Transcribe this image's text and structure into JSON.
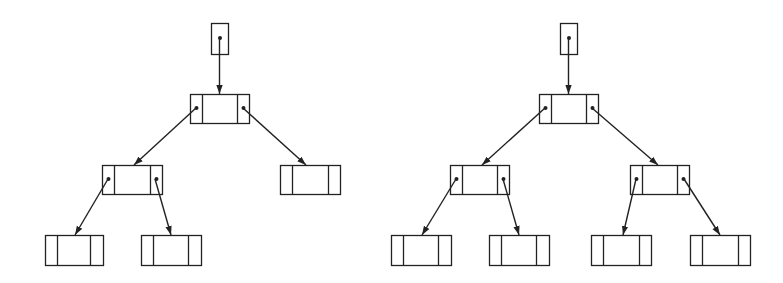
{
  "diagram": {
    "title": "",
    "stroke_color": "#222222",
    "background": "#ffffff",
    "trees": [
      {
        "id": "tree-left",
        "pointer": {
          "x": 211,
          "y": 23,
          "w": 17,
          "h": 31
        },
        "nodes": [
          {
            "id": "root",
            "x": 190,
            "y": 94,
            "w": 59,
            "h": 29,
            "d1": 202,
            "d2": 237,
            "has_left": true,
            "has_right": true
          },
          {
            "id": "L",
            "x": 102,
            "y": 165,
            "w": 60,
            "h": 29,
            "d1": 114,
            "d2": 150,
            "has_left": true,
            "has_right": true
          },
          {
            "id": "R",
            "x": 280,
            "y": 165,
            "w": 60,
            "h": 29,
            "d1": 292,
            "d2": 328,
            "has_left": false,
            "has_right": false
          },
          {
            "id": "LL",
            "x": 45,
            "y": 235,
            "w": 58,
            "h": 30,
            "d1": 57,
            "d2": 90,
            "has_left": false,
            "has_right": false
          },
          {
            "id": "LR",
            "x": 141,
            "y": 235,
            "w": 60,
            "h": 30,
            "d1": 153,
            "d2": 188,
            "has_left": false,
            "has_right": false
          }
        ],
        "edges": [
          {
            "from": "pointer",
            "to": "root",
            "x1": 219.5,
            "y1": 38,
            "x2": 219.5,
            "y2": 94
          },
          {
            "from": "root",
            "to": "L",
            "x1": 196,
            "y1": 108,
            "x2": 134,
            "y2": 165
          },
          {
            "from": "root",
            "to": "R",
            "x1": 243,
            "y1": 108,
            "x2": 306,
            "y2": 165
          },
          {
            "from": "L",
            "to": "LL",
            "x1": 108,
            "y1": 179,
            "x2": 75,
            "y2": 235
          },
          {
            "from": "L",
            "to": "LR",
            "x1": 155,
            "y1": 179,
            "x2": 171,
            "y2": 235
          }
        ]
      },
      {
        "id": "tree-right",
        "pointer": {
          "x": 560,
          "y": 23,
          "w": 17,
          "h": 31
        },
        "nodes": [
          {
            "id": "root",
            "x": 539,
            "y": 94,
            "w": 59,
            "h": 29,
            "d1": 551,
            "d2": 586,
            "has_left": true,
            "has_right": true
          },
          {
            "id": "L",
            "x": 450,
            "y": 165,
            "w": 59,
            "h": 29,
            "d1": 462,
            "d2": 497,
            "has_left": true,
            "has_right": true
          },
          {
            "id": "R",
            "x": 630,
            "y": 165,
            "w": 59,
            "h": 29,
            "d1": 642,
            "d2": 677,
            "has_left": true,
            "has_right": true
          },
          {
            "id": "LL",
            "x": 391,
            "y": 235,
            "w": 60,
            "h": 30,
            "d1": 403,
            "d2": 438,
            "has_left": false,
            "has_right": false
          },
          {
            "id": "LR",
            "x": 489,
            "y": 235,
            "w": 60,
            "h": 30,
            "d1": 501,
            "d2": 536,
            "has_left": false,
            "has_right": false
          },
          {
            "id": "RL",
            "x": 591,
            "y": 235,
            "w": 60,
            "h": 30,
            "d1": 603,
            "d2": 639,
            "has_left": false,
            "has_right": false
          },
          {
            "id": "RR",
            "x": 690,
            "y": 235,
            "w": 60,
            "h": 30,
            "d1": 702,
            "d2": 738,
            "has_left": false,
            "has_right": false
          }
        ],
        "edges": [
          {
            "from": "pointer",
            "to": "root",
            "x1": 568.5,
            "y1": 38,
            "x2": 568.5,
            "y2": 94
          },
          {
            "from": "root",
            "to": "L",
            "x1": 545,
            "y1": 108,
            "x2": 482,
            "y2": 165
          },
          {
            "from": "root",
            "to": "R",
            "x1": 592,
            "y1": 108,
            "x2": 658,
            "y2": 165
          },
          {
            "from": "L",
            "to": "LL",
            "x1": 456,
            "y1": 179,
            "x2": 422,
            "y2": 235
          },
          {
            "from": "L",
            "to": "LR",
            "x1": 503,
            "y1": 179,
            "x2": 519,
            "y2": 235
          },
          {
            "from": "R",
            "to": "RL",
            "x1": 636,
            "y1": 179,
            "x2": 623,
            "y2": 235
          },
          {
            "from": "R",
            "to": "RR",
            "x1": 684,
            "y1": 179,
            "x2": 720,
            "y2": 235
          }
        ]
      }
    ]
  }
}
